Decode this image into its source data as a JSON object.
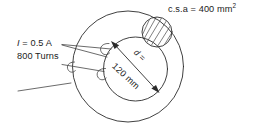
{
  "figure": {
    "type": "toroid-cross-section-diagram",
    "width": 253,
    "height": 133,
    "background": "#ffffff",
    "stroke_color": "#2b2b2b",
    "text_color": "#1b1b1b"
  },
  "labels": {
    "csa_prefix": "c.s.a = 400 mm",
    "csa_exponent": "2",
    "current_symbol": "I",
    "current_value": " = 0.5 A",
    "turns": "800 Turns",
    "diameter_symbol": "d =",
    "diameter_value": "120 mm"
  },
  "geometry": {
    "outer_circle": {
      "cx": 128,
      "cy": 66.5,
      "r": 55.5
    },
    "inner_circle": {
      "cx": 135.5,
      "cy": 69,
      "r": 32
    },
    "csa_circle": {
      "cx": 157,
      "cy": 32,
      "r": 15
    },
    "diameter_arrow": {
      "x1": 112,
      "y1": 42,
      "x2": 158.5,
      "y2": 92
    },
    "coil_loops": 3,
    "leader_lines": 3
  }
}
